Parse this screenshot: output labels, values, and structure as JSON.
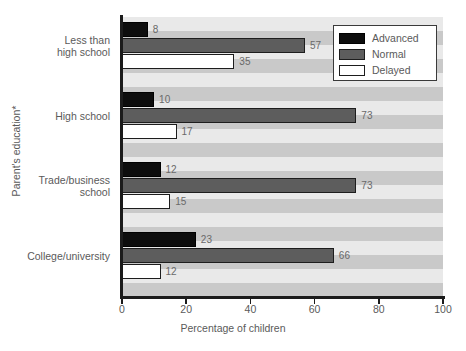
{
  "chart_data": {
    "type": "bar",
    "orientation": "horizontal",
    "title": "",
    "xlabel": "Percentage of children",
    "ylabel": "Parent's education*",
    "xlim": [
      0,
      100
    ],
    "xticks": [
      0,
      20,
      40,
      60,
      80,
      100
    ],
    "grid": false,
    "legend_position": "top-right",
    "categories": [
      "Less than high school",
      "High school",
      "Trade/business school",
      "College/university"
    ],
    "category_lines": [
      [
        "Less than",
        "high school"
      ],
      [
        "High school"
      ],
      [
        "Trade/business",
        "school"
      ],
      [
        "College/university"
      ]
    ],
    "series": [
      {
        "name": "Advanced",
        "color": "#0d0d0d",
        "values": [
          8,
          10,
          12,
          23
        ]
      },
      {
        "name": "Normal",
        "color": "#5d5d5d",
        "values": [
          57,
          73,
          73,
          66
        ]
      },
      {
        "name": "Delayed",
        "color": "#ffffff",
        "values": [
          35,
          17,
          15,
          12
        ]
      }
    ]
  },
  "legend": {
    "items": [
      {
        "label": "Advanced",
        "swatch": "advanced"
      },
      {
        "label": "Normal",
        "swatch": "normal"
      },
      {
        "label": "Delayed",
        "swatch": "delayed"
      }
    ]
  },
  "axes": {
    "x_title": "Percentage of children",
    "y_title": "Parent's education*",
    "x_tick_labels": [
      "0",
      "20",
      "40",
      "60",
      "80",
      "100"
    ]
  },
  "colors": {
    "advanced": "#0d0d0d",
    "normal": "#5d5d5d",
    "delayed": "#ffffff",
    "stripe_dark": "#c9c9c9",
    "stripe_light": "#e9e9e9",
    "axis": "#1b1b1b",
    "text": "#5a5a5a"
  }
}
